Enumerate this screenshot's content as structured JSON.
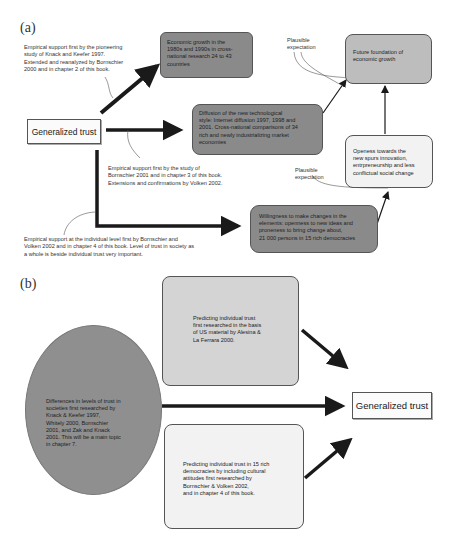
{
  "panel_a": {
    "label": "(a)",
    "center_node": "Generalized trust",
    "boxes": {
      "economic_growth": "Economic growth in the\n1980s and 1990s in cross-\nnational research 24 to 43\ncountries",
      "diffusion": "Diffusion of the new technological\nstyle: Internet diffusion 1997, 1998 and\n2001. Cross-national comparisons of 34\nrich and newly industrializing market\neconomies",
      "willingness": "Willingness to make changes in the\nelements: openness to new ideas and\nproneness to bring change about,\n21 000 persons in 15 rich democracies",
      "future_foundation": "Future foundation of\neconomic growth",
      "openness": "Openess towards the\nnew spurs innovation,\nentrpreneurship and less\nconflictual social change"
    },
    "annotations": {
      "note_knack": "Empirical support first by the pioneering\nstudy of Knack and Keefer 1997.\nExtended and reanalyzed by Bornschier\n2000 and in chapter 2 of this book.",
      "note_bornschier2001": "Empirical support first by the study of\nBornschier 2001 and in chapter 3 of this book.\nExtensions and confirmations by Volken 2002.",
      "note_individual": "Empirical support at the individual level first by Bornschier and\nVolken 2002 and in chapter 4 of this book. Level of trust in society as\na whole is beside individual trust very important.",
      "plausible_1": "Plausible\nexpectation",
      "plausible_2": "Plausible\nexpectation"
    }
  },
  "panel_b": {
    "label": "(b)",
    "target_node": "Generalized trust",
    "ellipse": "Differences in levels of trust in\nsocieties first researched by\nKnack & Keefer 1997,\nWhitely 2000, Bornschier\n2001, and Zak and Knack\n2001. This will be a main topic\nin chapter 7.",
    "box_top": "Predicting individual trust\nfirst researched in the basis\nof US material by Alesina &\nLa Ferrara 2000.",
    "box_bottom": "Predicting individual trust in 15 rich\ndemocracies by including cultural\nattitudes first researched by\nBornschier & Volken 2002,\nand in chapter 4 of this book."
  },
  "colors": {
    "dark_box": "#8a8a8a",
    "mid_box": "#bdbdbd",
    "light_box": "#f2f2f2",
    "arrow": "#1a1a1a"
  }
}
